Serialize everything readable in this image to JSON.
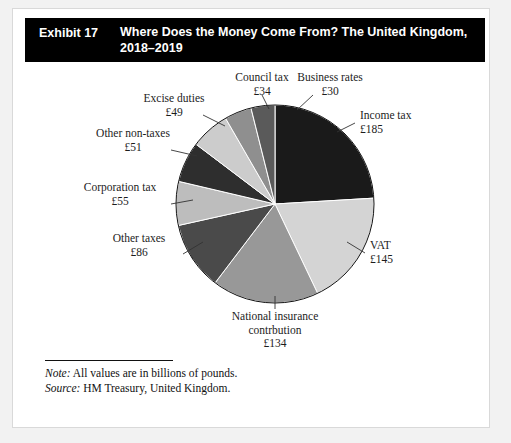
{
  "header": {
    "exhibit_number": "Exhibit 17",
    "title": "Where Does the Money Come From? The United Kingdom, 2018–2019"
  },
  "footnotes": {
    "note_key": "Note:",
    "note_text": " All values are in billions of pounds.",
    "source_key": "Source:",
    "source_text": " HM Treasury, United Kingdom."
  },
  "labels": {
    "income_tax": {
      "name": "Income tax",
      "amount": "£185"
    },
    "vat": {
      "name": "VAT",
      "amount": "£145"
    },
    "national_insurance": {
      "name_line1": "National insurance",
      "name_line2": "contrbution",
      "amount": "£134"
    },
    "other_taxes": {
      "name": "Other taxes",
      "amount": "£86"
    },
    "corporation_tax": {
      "name": "Corporation tax",
      "amount": "£55"
    },
    "other_non_taxes": {
      "name": "Other non-taxes",
      "amount": "£51"
    },
    "excise_duties": {
      "name": "Excise duties",
      "amount": "£49"
    },
    "council_tax": {
      "name": "Council tax",
      "amount": "£34"
    },
    "business_rates": {
      "name": "Business rates",
      "amount": "£30"
    }
  },
  "chart_data": {
    "type": "pie",
    "title": "Where Does the Money Come From? The United Kingdom, 2018–2019",
    "unit": "billions of pounds",
    "currency_symbol": "£",
    "total": 769,
    "start_angle_deg": 0,
    "direction": "clockwise",
    "legend": "none (direct labels with leader lines)",
    "categories": [
      "Income tax",
      "VAT",
      "National insurance contrbution",
      "Other taxes",
      "Corporation tax",
      "Other non-taxes",
      "Excise duties",
      "Council tax",
      "Business rates"
    ],
    "values": [
      185,
      145,
      134,
      86,
      55,
      51,
      49,
      34,
      30
    ],
    "colors": [
      "#1a1a1a",
      "#d4d4d4",
      "#989898",
      "#4a4a4a",
      "#bdbdbd",
      "#2e2e2e",
      "#cccccc",
      "#8f8f8f",
      "#5a5a5a"
    ],
    "slice_border_color": "#ffffff",
    "outline_color": "#111111"
  }
}
